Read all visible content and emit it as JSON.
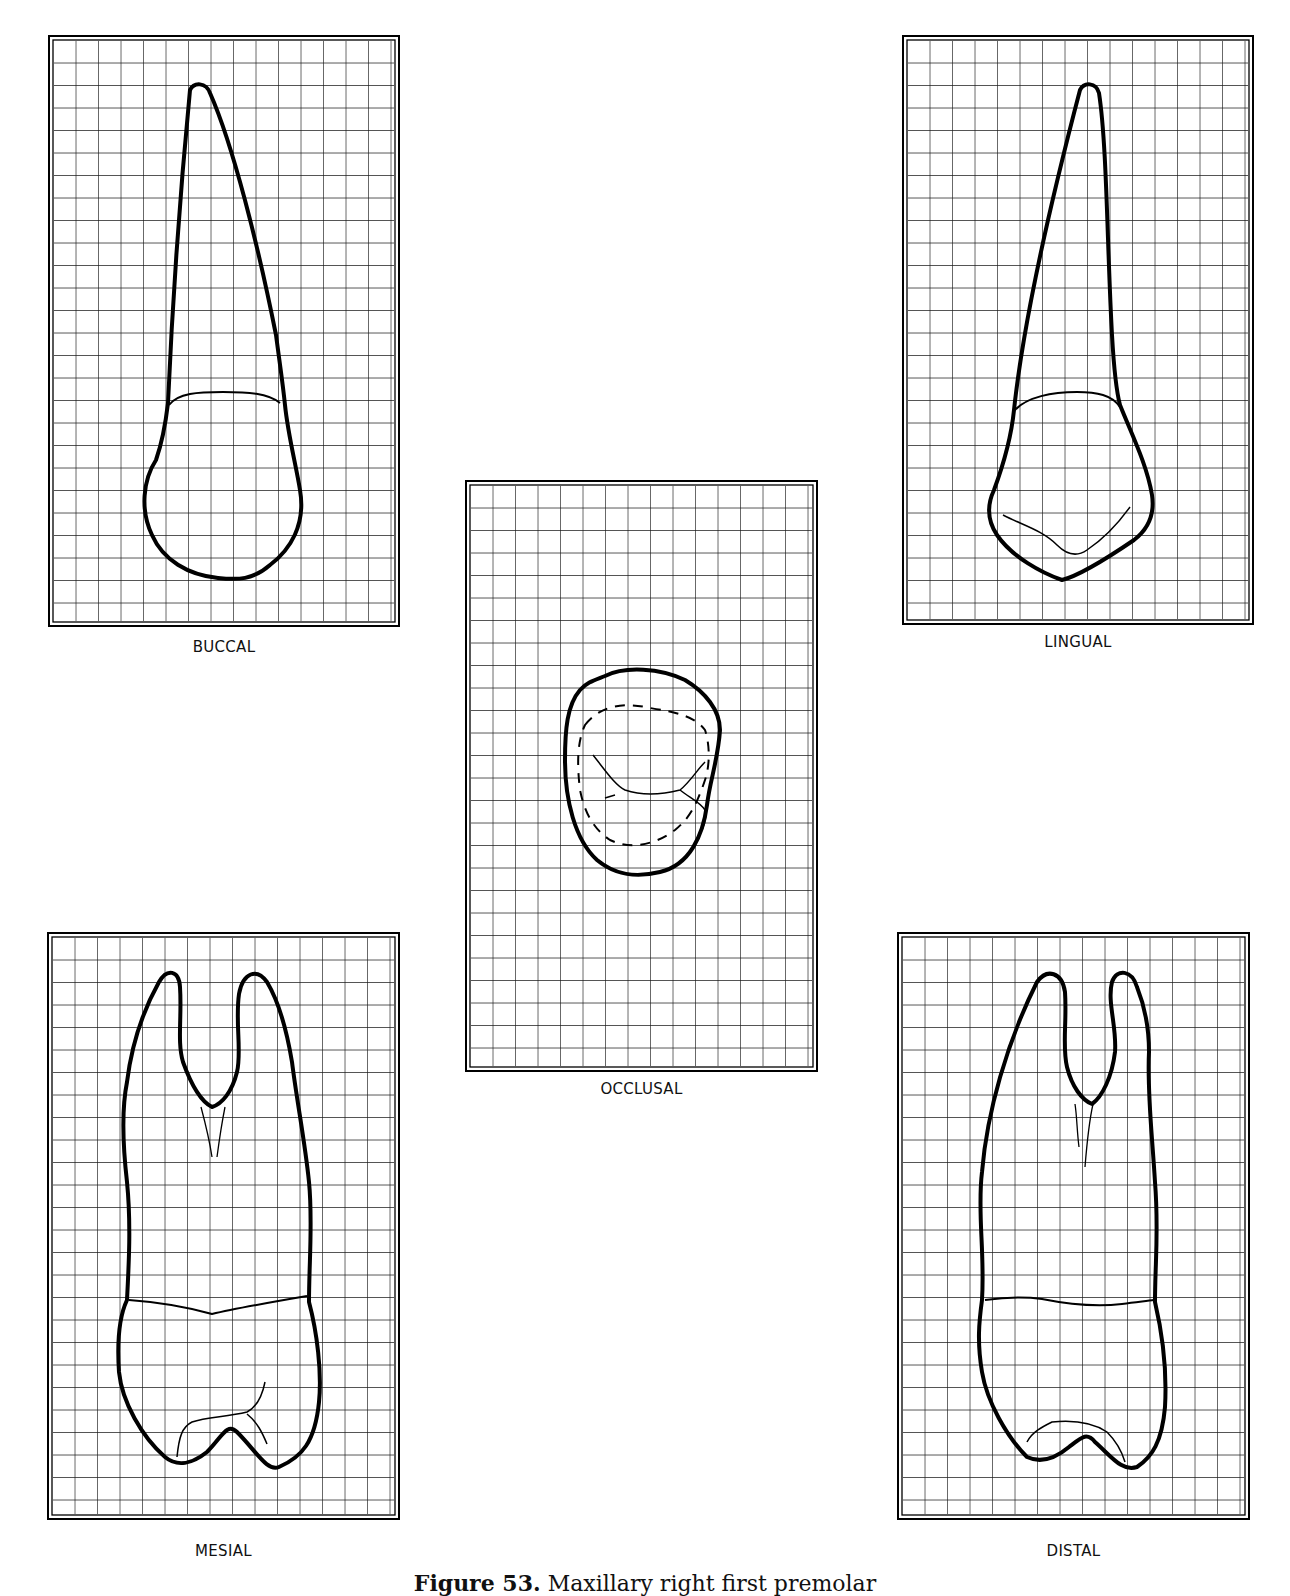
{
  "figure": {
    "caption_prefix": "Figure 53.",
    "caption_text": "Maxillary right first premolar",
    "grid_color": "#1a1a1a",
    "outline_color": "#000000"
  },
  "views": [
    {
      "id": "buccal",
      "label": "BUCCAL",
      "x": 48,
      "y": 35,
      "w": 352,
      "h": 592
    },
    {
      "id": "lingual",
      "label": "LINGUAL",
      "x": 902,
      "y": 35,
      "w": 352,
      "h": 590
    },
    {
      "id": "occlusal",
      "label": "OCCLUSAL",
      "x": 465,
      "y": 480,
      "w": 353,
      "h": 592
    },
    {
      "id": "mesial",
      "label": "MESIAL",
      "x": 47,
      "y": 932,
      "w": 353,
      "h": 588
    },
    {
      "id": "distal",
      "label": "DISTAL",
      "x": 897,
      "y": 932,
      "w": 353,
      "h": 588
    }
  ]
}
